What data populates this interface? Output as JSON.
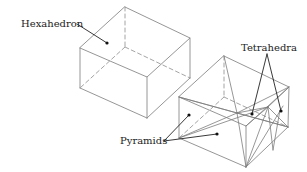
{
  "figure": {
    "labels": {
      "hexahedron": "Hexahedron",
      "tetrahedra": "Tetrahedra",
      "pyramids": "Pyramids"
    },
    "colors": {
      "edge": "#8a8a8a",
      "leader": "#222222",
      "background": "#ffffff"
    },
    "shapes": [
      {
        "name": "hexahedron",
        "description": "Single hexahedral element drawn as wireframe box with dashed hidden edges"
      },
      {
        "name": "decomposed-hexahedron",
        "description": "Same box subdivided into pyramids and tetrahedra"
      }
    ]
  }
}
